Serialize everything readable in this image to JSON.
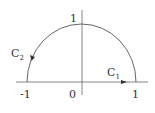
{
  "diagram": {
    "type": "contour",
    "axis_labels": {
      "x_neg": "-1",
      "origin": "0",
      "x_pos": "1",
      "y_top": "1"
    },
    "curves": [
      {
        "name": "C",
        "sub": "1",
        "path": "line segment from -1 to 1 on real axis",
        "direction": "rightward"
      },
      {
        "name": "C",
        "sub": "2",
        "path": "upper semicircle from 1 to -1",
        "direction": "counterclockwise"
      }
    ],
    "colors": {
      "stroke": "#555555",
      "text": "#333333"
    }
  }
}
